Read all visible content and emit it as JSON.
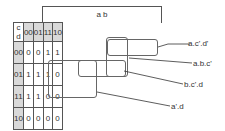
{
  "kmap": {
    "column_variable_label": "a b",
    "row_variable_label": "c d",
    "column_headers": [
      "00",
      "01",
      "11",
      "10"
    ],
    "rows": [
      {
        "header": "00",
        "cells": [
          "0",
          "0",
          "1",
          "1"
        ]
      },
      {
        "header": "01",
        "cells": [
          "1",
          "1",
          "1",
          "0"
        ]
      },
      {
        "header": "11",
        "cells": [
          "1",
          "1",
          "0",
          "0"
        ]
      },
      {
        "header": "10",
        "cells": [
          "0",
          "0",
          "0",
          "0"
        ]
      }
    ]
  },
  "groupings": [
    {
      "label": "a.c'.d'"
    },
    {
      "label": "a.b.c'"
    },
    {
      "label": "b.c'.d"
    },
    {
      "label": "a'.d"
    }
  ]
}
